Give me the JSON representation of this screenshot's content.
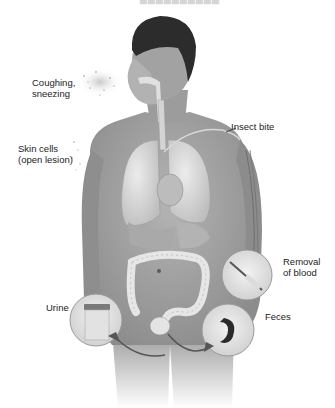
{
  "figure": {
    "type": "anatomical-diagram",
    "style": "grayscale-illustration",
    "colors": {
      "background": "#ffffff",
      "skin": "#a8a8a8",
      "skin_dark": "#7a7a7a",
      "hair": "#2a2a2a",
      "organ_light": "#dcdcdc",
      "organ_mid": "#bdbdbd",
      "label_text": "#222222",
      "inset_border": "#9a9a9a",
      "feces": "#2b2b2b"
    }
  },
  "labels": {
    "coughing": "Coughing,\nsneezing",
    "skin_cells": "Skin cells\n(open lesion)",
    "insect_bite": "Insect bite",
    "removal_of_blood": "Removal\nof blood",
    "urine": "Urine",
    "feces": "Feces"
  },
  "insets": [
    {
      "name": "blood-draw-inset",
      "label_ref": "removal_of_blood"
    },
    {
      "name": "urine-cup-inset",
      "label_ref": "urine"
    },
    {
      "name": "feces-inset",
      "label_ref": "feces"
    }
  ]
}
